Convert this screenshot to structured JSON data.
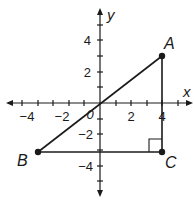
{
  "diagram": {
    "type": "coordinate-plane-triangle",
    "axes": {
      "x_label": "x",
      "y_label": "y",
      "origin_label": "0",
      "x_range": [
        -6,
        6
      ],
      "y_range": [
        -6,
        6
      ],
      "x_tick_labels": [
        "-4",
        "-2",
        "2",
        "4"
      ],
      "y_tick_labels": [
        "4",
        "2",
        "-2",
        "-4"
      ]
    },
    "points": [
      {
        "name": "A",
        "x": 4,
        "y": 3
      },
      {
        "name": "B",
        "x": -4,
        "y": -3
      },
      {
        "name": "C",
        "x": 4,
        "y": -3
      }
    ],
    "segments": [
      {
        "from": "A",
        "to": "B"
      },
      {
        "from": "B",
        "to": "C"
      },
      {
        "from": "C",
        "to": "A"
      }
    ],
    "right_angle_at": "C",
    "colors": {
      "ink": "#1a1a1a",
      "background": "#ffffff"
    }
  },
  "labels": {
    "x_axis": "x",
    "y_axis": "y",
    "origin": "0",
    "xt_m4": "−4",
    "xt_m2": "−2",
    "xt_2": "2",
    "xt_4": "4",
    "yt_4": "4",
    "yt_2": "2",
    "yt_m2": "−2",
    "yt_m4": "−4",
    "point_A": "A",
    "point_B": "B",
    "point_C": "C"
  }
}
